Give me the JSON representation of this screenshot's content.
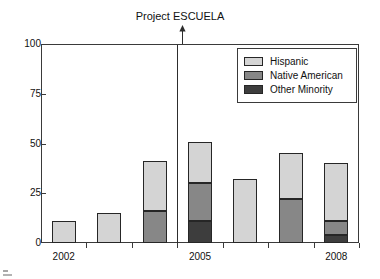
{
  "chart_data": {
    "type": "bar",
    "title": "",
    "xlabel": "",
    "ylabel": "",
    "ylim": [
      0,
      100
    ],
    "y_ticks": [
      "0",
      "25",
      "50",
      "75",
      "100"
    ],
    "grid": false,
    "stacked": true,
    "legend_position": "top-right",
    "categories": [
      "2002",
      "2003",
      "2004",
      "2005",
      "2006",
      "2007",
      "2008"
    ],
    "x_tick_labels": [
      "2002",
      "2005",
      "2008"
    ],
    "x_tick_label_indices": [
      0,
      3,
      6
    ],
    "series": [
      {
        "name": "Hispanic",
        "color": "#d4d4d4",
        "values": [
          11,
          15,
          25,
          21,
          32,
          23,
          29
        ]
      },
      {
        "name": "Native American",
        "color": "#878787",
        "values": [
          0,
          0,
          16,
          19,
          0,
          22,
          7
        ]
      },
      {
        "name": "Other Minority",
        "color": "#3d3d3d",
        "values": [
          0,
          0,
          0,
          11,
          0,
          0,
          4
        ]
      }
    ],
    "totals": [
      11,
      15,
      41,
      51,
      32,
      45,
      40
    ],
    "annotations": [
      {
        "text": "Project ESCUELA",
        "marker": "down-arrow",
        "at_category": "2005",
        "line": "vertical"
      }
    ]
  },
  "legend": {
    "items": [
      {
        "label": "Hispanic",
        "color": "#d4d4d4"
      },
      {
        "label": "Native American",
        "color": "#878787"
      },
      {
        "label": "Other Minority",
        "color": "#3d3d3d"
      }
    ]
  },
  "annotation": {
    "label": "Project ESCUELA"
  }
}
